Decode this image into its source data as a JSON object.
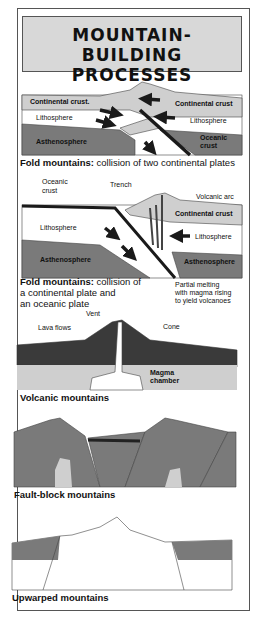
{
  "title": {
    "line1": "MOUNTAIN-BUILDING",
    "line2": "PROCESSES"
  },
  "colors": {
    "dark_gray": "#7a7a7a",
    "light_gray": "#cfcfcf",
    "black": "#1a1a1a",
    "title_bg": "#d8d8d8"
  },
  "panels": [
    {
      "caption_bold": "Fold mountains:",
      "caption_rest": " collision of two continental plates",
      "labels": [
        "Continental crust.",
        "Continental crust",
        "Lithosphere",
        "Lithosphere",
        "Asthenosphere",
        "Oceanic",
        "crust"
      ]
    },
    {
      "caption_bold": "Fold mountains:",
      "caption_rest": " collision of",
      "caption_line2": "a continental plate and",
      "caption_line3": "an oceanic plate",
      "labels": [
        "Oceanic",
        "crust",
        "Trench",
        "Volcanic arc",
        "Continental crust",
        "Lithosphere",
        "Lithosphere",
        "Asthenosphere",
        "Asthenosphere",
        "Partial melting",
        "with magma rising",
        "to yield volcanoes"
      ]
    },
    {
      "caption_bold": "Volcanic mountains",
      "labels": [
        "Vent",
        "Lava flows",
        "Cone",
        "Magma",
        "chamber"
      ]
    },
    {
      "caption_bold": "Fault-block mountains"
    },
    {
      "caption_bold": "Upwarped mountains"
    }
  ]
}
